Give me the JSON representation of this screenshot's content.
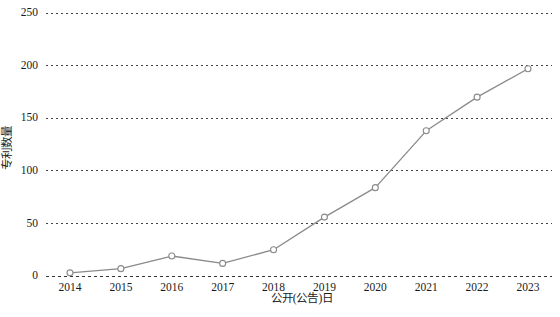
{
  "chart_data": {
    "type": "line",
    "title": "",
    "subtitle": "",
    "xlabel": "公开(公告)日",
    "ylabel": "专利数量",
    "categories": [
      "2014",
      "2015",
      "2016",
      "2017",
      "2018",
      "2019",
      "2020",
      "2021",
      "2022",
      "2023"
    ],
    "values": [
      3,
      7,
      19,
      12,
      25,
      56,
      84,
      138,
      170,
      197
    ],
    "series": [
      {
        "name": "专利数量",
        "values": [
          3,
          7,
          19,
          12,
          25,
          56,
          84,
          138,
          170,
          197
        ]
      }
    ],
    "ylim": [
      0,
      250
    ],
    "yticks": [
      0,
      50,
      100,
      150,
      200,
      250
    ],
    "ytick_labels": [
      "0",
      "50",
      "100",
      "150",
      "200",
      "250"
    ],
    "xtick_labels": [
      "2014",
      "2015",
      "2016",
      "2017",
      "2018",
      "2019",
      "2020",
      "2021",
      "2022",
      "2023"
    ],
    "grid": true,
    "grid_style": "dotted",
    "grid_axis": "y",
    "legend": false,
    "legend_position": "none",
    "line_color": "#8a8a8a",
    "marker_style": "open-circle",
    "marker_fill": "#ffffff",
    "background_color": "#ffffff",
    "annotations": []
  }
}
